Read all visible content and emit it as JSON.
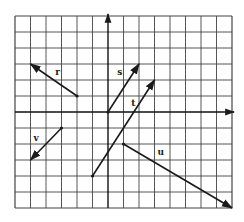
{
  "diagram": {
    "type": "vector-grid",
    "grid": {
      "columns": 14,
      "rows": 12,
      "origin_column": 6,
      "origin_row": 6,
      "left_px": 15,
      "top_px": 16,
      "cell_w": 15.5,
      "cell_h": 16
    },
    "axes": {
      "x_arrow": true,
      "y_arrow": true
    },
    "vectors": [
      {
        "name": "r",
        "label": "r",
        "tail": [
          -2,
          1
        ],
        "head": [
          -5,
          3
        ],
        "label_pos": [
          -3.4,
          2.3
        ]
      },
      {
        "name": "s",
        "label": "s",
        "tail": [
          0,
          0
        ],
        "head": [
          2,
          3
        ],
        "label_pos": [
          0.6,
          2.3
        ]
      },
      {
        "name": "t",
        "label": "t",
        "tail": [
          -1,
          -4
        ],
        "head": [
          3,
          2
        ],
        "label_pos": [
          1.5,
          0.4
        ]
      },
      {
        "name": "u",
        "label": "u",
        "tail": [
          1,
          -2
        ],
        "head": [
          8,
          -6
        ],
        "label_pos": [
          3.2,
          -2.7
        ]
      },
      {
        "name": "v",
        "label": "v",
        "tail": [
          -3,
          -1
        ],
        "head": [
          -5,
          -3
        ],
        "label_pos": [
          -4.8,
          -1.8
        ]
      }
    ],
    "colors": {
      "grid": "#444444",
      "vector": "#1a1a1a",
      "background": "#ffffff"
    }
  }
}
